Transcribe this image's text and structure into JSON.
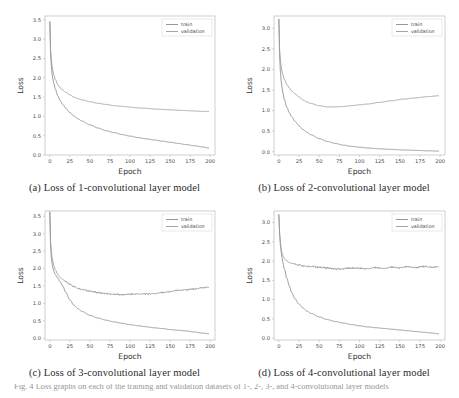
{
  "figure": {
    "footer_caption": "Fig. 4 Loss graphs on each of the training and validation datasets of 1-, 2-, 3-, and 4-convolutional layer models",
    "series_colors": {
      "train": "#8a8a8a",
      "validation": "#9a9a9a"
    },
    "legend": {
      "train_label": "train",
      "validation_label": "validation"
    },
    "axis": {
      "xlabel": "Epoch",
      "ylabel": "Loss"
    }
  },
  "chart_data": [
    {
      "id": "panel-a",
      "type": "line",
      "title": "(a) Loss of 1-convolutional layer model",
      "xlabel": "Epoch",
      "ylabel": "Loss",
      "xlim": [
        -6,
        206
      ],
      "ylim": [
        0.0,
        3.6
      ],
      "xticks": [
        0,
        25,
        50,
        75,
        100,
        125,
        150,
        175,
        200
      ],
      "yticks": [
        0.0,
        0.5,
        1.0,
        1.5,
        2.0,
        2.5,
        3.0,
        3.5
      ],
      "grid": false,
      "legend_position": "upper right",
      "x": [
        0,
        1,
        2,
        3,
        4,
        5,
        7,
        10,
        13,
        16,
        20,
        25,
        30,
        35,
        40,
        50,
        60,
        70,
        80,
        90,
        100,
        110,
        120,
        130,
        140,
        150,
        160,
        170,
        180,
        190,
        198
      ],
      "series": [
        {
          "name": "train",
          "values": [
            3.45,
            2.62,
            2.28,
            2.08,
            1.95,
            1.85,
            1.7,
            1.53,
            1.41,
            1.31,
            1.21,
            1.1,
            1.01,
            0.94,
            0.88,
            0.78,
            0.7,
            0.63,
            0.58,
            0.53,
            0.49,
            0.45,
            0.42,
            0.39,
            0.36,
            0.33,
            0.3,
            0.27,
            0.24,
            0.21,
            0.18
          ]
        },
        {
          "name": "validation",
          "values": [
            3.45,
            2.72,
            2.45,
            2.28,
            2.16,
            2.07,
            1.95,
            1.82,
            1.74,
            1.68,
            1.62,
            1.56,
            1.5,
            1.46,
            1.43,
            1.38,
            1.34,
            1.31,
            1.28,
            1.26,
            1.24,
            1.22,
            1.21,
            1.19,
            1.18,
            1.17,
            1.16,
            1.15,
            1.14,
            1.13,
            1.13
          ]
        }
      ]
    },
    {
      "id": "panel-b",
      "type": "line",
      "title": "(b) Loss of 2-convolutional layer model",
      "xlabel": "Epoch",
      "ylabel": "Loss",
      "xlim": [
        -6,
        206
      ],
      "ylim": [
        -0.08,
        3.3
      ],
      "xticks": [
        0,
        25,
        50,
        75,
        100,
        125,
        150,
        175,
        200
      ],
      "yticks": [
        0.0,
        0.5,
        1.0,
        1.5,
        2.0,
        2.5,
        3.0
      ],
      "grid": false,
      "legend_position": "upper right",
      "x": [
        0,
        1,
        2,
        3,
        4,
        5,
        7,
        10,
        13,
        16,
        20,
        25,
        30,
        35,
        40,
        50,
        60,
        70,
        80,
        90,
        100,
        110,
        125,
        140,
        155,
        170,
        185,
        198
      ],
      "series": [
        {
          "name": "train",
          "values": [
            3.22,
            2.3,
            1.92,
            1.7,
            1.55,
            1.43,
            1.26,
            1.08,
            0.95,
            0.85,
            0.74,
            0.63,
            0.54,
            0.47,
            0.41,
            0.32,
            0.25,
            0.2,
            0.16,
            0.13,
            0.11,
            0.09,
            0.07,
            0.055,
            0.042,
            0.032,
            0.022,
            0.015
          ]
        },
        {
          "name": "validation",
          "values": [
            3.22,
            2.48,
            2.22,
            2.06,
            1.95,
            1.87,
            1.75,
            1.63,
            1.55,
            1.48,
            1.41,
            1.33,
            1.26,
            1.21,
            1.17,
            1.12,
            1.09,
            1.09,
            1.1,
            1.12,
            1.14,
            1.16,
            1.2,
            1.24,
            1.28,
            1.31,
            1.34,
            1.36
          ]
        }
      ]
    },
    {
      "id": "panel-c",
      "type": "line",
      "title": "(c) Loss of 3-convolutional layer model",
      "xlabel": "Epoch",
      "ylabel": "Loss",
      "xlim": [
        -6,
        206
      ],
      "ylim": [
        -0.05,
        3.65
      ],
      "xticks": [
        0,
        25,
        50,
        75,
        100,
        125,
        150,
        175,
        200
      ],
      "yticks": [
        0.0,
        0.5,
        1.0,
        1.5,
        2.0,
        2.5,
        3.0,
        3.5
      ],
      "grid": false,
      "legend_position": "upper right",
      "x": [
        0,
        1,
        2,
        3,
        4,
        5,
        7,
        10,
        13,
        16,
        20,
        25,
        30,
        35,
        40,
        50,
        60,
        70,
        80,
        90,
        100,
        110,
        120,
        130,
        140,
        150,
        160,
        170,
        180,
        190,
        198
      ],
      "series": [
        {
          "name": "train",
          "values": [
            3.62,
            2.62,
            2.3,
            2.12,
            2.0,
            1.92,
            1.82,
            1.72,
            1.62,
            1.5,
            1.32,
            1.1,
            0.95,
            0.85,
            0.77,
            0.66,
            0.58,
            0.52,
            0.47,
            0.43,
            0.39,
            0.36,
            0.33,
            0.3,
            0.28,
            0.25,
            0.23,
            0.21,
            0.18,
            0.15,
            0.13
          ]
        },
        {
          "name": "validation",
          "values": [
            3.62,
            2.75,
            2.48,
            2.3,
            2.18,
            2.08,
            1.96,
            1.83,
            1.74,
            1.68,
            1.62,
            1.55,
            1.49,
            1.44,
            1.4,
            1.35,
            1.31,
            1.28,
            1.26,
            1.25,
            1.26,
            1.27,
            1.27,
            1.28,
            1.31,
            1.33,
            1.37,
            1.39,
            1.41,
            1.45,
            1.46
          ]
        }
      ]
    },
    {
      "id": "panel-d",
      "type": "line",
      "title": "(d) Loss of 4-convolutional layer model",
      "xlabel": "Epoch",
      "ylabel": "Loss",
      "xlim": [
        -6,
        206
      ],
      "ylim": [
        -0.05,
        3.3
      ],
      "xticks": [
        0,
        25,
        50,
        75,
        100,
        125,
        150,
        175,
        200
      ],
      "yticks": [
        0.0,
        0.5,
        1.0,
        1.5,
        2.0,
        2.5,
        3.0
      ],
      "grid": false,
      "legend_position": "upper right",
      "x": [
        0,
        1,
        2,
        3,
        4,
        5,
        7,
        10,
        13,
        16,
        20,
        25,
        30,
        35,
        40,
        50,
        60,
        70,
        80,
        90,
        100,
        110,
        120,
        130,
        140,
        150,
        160,
        170,
        180,
        190,
        198
      ],
      "series": [
        {
          "name": "train",
          "values": [
            3.2,
            2.7,
            2.4,
            2.22,
            2.08,
            1.96,
            1.78,
            1.55,
            1.35,
            1.18,
            1.02,
            0.88,
            0.78,
            0.7,
            0.64,
            0.55,
            0.48,
            0.43,
            0.39,
            0.35,
            0.32,
            0.29,
            0.27,
            0.25,
            0.23,
            0.21,
            0.19,
            0.17,
            0.15,
            0.13,
            0.11
          ]
        },
        {
          "name": "validation",
          "values": [
            3.2,
            2.72,
            2.48,
            2.32,
            2.2,
            2.14,
            2.06,
            2.0,
            1.96,
            1.94,
            1.92,
            1.9,
            1.88,
            1.87,
            1.86,
            1.84,
            1.82,
            1.79,
            1.8,
            1.82,
            1.81,
            1.8,
            1.83,
            1.81,
            1.84,
            1.82,
            1.85,
            1.83,
            1.86,
            1.84,
            1.85
          ]
        }
      ]
    }
  ]
}
